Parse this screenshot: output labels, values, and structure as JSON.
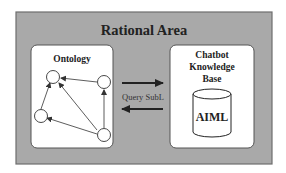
{
  "diagram": {
    "title": "Rational Area",
    "colors": {
      "area_fill": "#a9a9a9",
      "area_border": "#6e6e6e",
      "panel_fill": "#ffffff",
      "stroke": "#333333"
    },
    "ontology": {
      "label": "Ontology",
      "nodes": [
        "top",
        "right",
        "left",
        "bottom-right"
      ],
      "edges": [
        {
          "from": "right",
          "to": "top"
        },
        {
          "from": "left",
          "to": "top"
        },
        {
          "from": "bottom-right",
          "to": "top"
        },
        {
          "from": "bottom-right",
          "to": "right"
        },
        {
          "from": "bottom-right",
          "to": "left"
        }
      ]
    },
    "knowledge_base": {
      "label_lines": [
        "Chatbot",
        "Knowledge",
        "Base"
      ],
      "store_label": "AIML"
    },
    "links": {
      "forward": {
        "from": "ontology",
        "to": "knowledge_base"
      },
      "backward": {
        "from": "knowledge_base",
        "to": "ontology",
        "label": "Query SubL"
      }
    }
  }
}
